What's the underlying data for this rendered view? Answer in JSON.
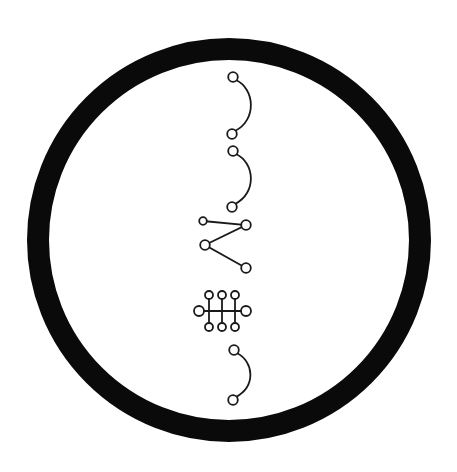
{
  "diagram": {
    "title": "",
    "background": "#ffffff",
    "ink_color": "#1a1a1a",
    "ring": {
      "shape": "circle",
      "center": [
        229,
        240
      ],
      "outer_radius": 202,
      "stroke_width": 22,
      "color": "#0a0a0a"
    },
    "symbols": [
      {
        "id": "arc-1",
        "type": "arc-with-end-circles",
        "start": [
          233,
          77
        ],
        "end": [
          232,
          134
        ],
        "bulge_x": 255
      },
      {
        "id": "arc-2",
        "type": "arc-with-end-circles",
        "start": [
          233,
          151
        ],
        "end": [
          232,
          207
        ],
        "bulge_x": 255
      },
      {
        "id": "zigzag",
        "type": "polyline-with-node-circles",
        "points": [
          [
            203,
            221
          ],
          [
            246,
            225
          ],
          [
            205,
            245
          ],
          [
            246,
            268
          ]
        ]
      },
      {
        "id": "ladder",
        "type": "crossbar-with-rungs",
        "bar": {
          "from": [
            199,
            311
          ],
          "to": [
            246,
            311
          ]
        },
        "rungs_x": [
          209,
          222,
          235
        ],
        "rung_top_y": 295,
        "rung_bottom_y": 327
      },
      {
        "id": "arc-3",
        "type": "arc-with-end-circles",
        "start": [
          234,
          350
        ],
        "end": [
          233,
          400
        ],
        "bulge_x": 254
      }
    ]
  }
}
